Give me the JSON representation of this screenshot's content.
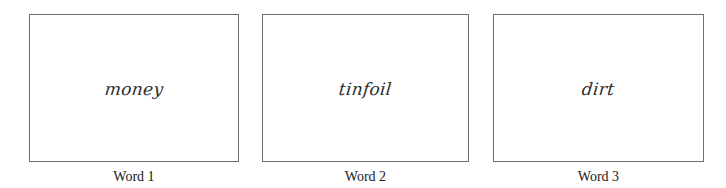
{
  "cards": [
    {
      "word": "money",
      "label": "Word 1"
    },
    {
      "word": "tinfoil",
      "label": "Word 2"
    },
    {
      "word": "dirt",
      "label": "Word 3"
    }
  ],
  "colors": {
    "border": "#6f6f6f",
    "text": "#1a1a1a",
    "background": "#ffffff"
  }
}
